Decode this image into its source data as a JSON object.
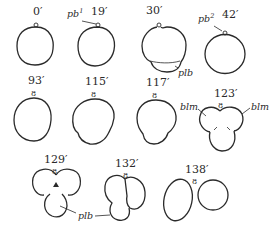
{
  "figure": {
    "stages": [
      {
        "time": "0′",
        "row": 1,
        "col": 1
      },
      {
        "time": "19′",
        "row": 1,
        "col": 2,
        "annotation": "pb",
        "annotation_sup": "1"
      },
      {
        "time": "30′",
        "row": 1,
        "col": 3,
        "annotation": "plb"
      },
      {
        "time": "42′",
        "row": 1,
        "col": 4,
        "annotation": "pb",
        "annotation_sup": "2"
      },
      {
        "time": "93′",
        "row": 2,
        "col": 1
      },
      {
        "time": "115′",
        "row": 2,
        "col": 2
      },
      {
        "time": "117′",
        "row": 2,
        "col": 3
      },
      {
        "time": "123′",
        "row": 2,
        "col": 4,
        "annotations": [
          "blm",
          "blm"
        ]
      },
      {
        "time": "129′",
        "row": 3,
        "col": 1
      },
      {
        "time": "132′",
        "row": 3,
        "col": 2
      },
      {
        "time": "138′",
        "row": 3,
        "col": 3
      }
    ],
    "shared_labels": {
      "plb_bottom": "plb"
    }
  }
}
